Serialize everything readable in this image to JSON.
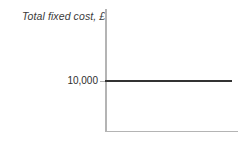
{
  "chart_data": {
    "type": "line",
    "title": "Total fixed cost, £",
    "xlabel": "",
    "ylabel": "",
    "grid": false,
    "legend": null,
    "ytick_labels": [
      "10,000"
    ],
    "ytick_values": [
      10000
    ],
    "xtick_labels": [],
    "series": [
      {
        "name": "Total fixed cost",
        "values": [
          10000,
          10000
        ],
        "x": [
          0,
          1
        ],
        "color": "#333333"
      }
    ],
    "annotations": [],
    "axis_color": "#b4b4b4",
    "line_color": "#333333",
    "background": "#ffffff"
  }
}
